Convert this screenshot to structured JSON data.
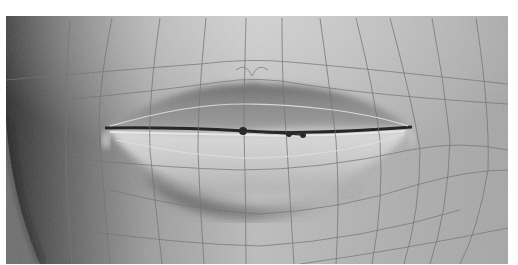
{
  "image": {
    "subject": "3D render of closed lips with wireframe mesh topology overlay",
    "palette": {
      "background_border": "#ffffff",
      "skin_light": "#cfcfcf",
      "skin_mid": "#a9a9a9",
      "skin_dark": "#3a3a3a",
      "mesh_line": "#6f6f6f",
      "lip_line_highlight": "#e2e2e2",
      "control_point": "#1e1e1e"
    },
    "control_points": [
      {
        "x": 243,
        "y": 131
      },
      {
        "x": 289,
        "y": 134
      },
      {
        "x": 303,
        "y": 135
      }
    ],
    "mouth_corners": {
      "left": {
        "x": 107,
        "y": 128
      },
      "right": {
        "x": 410,
        "y": 128
      }
    }
  }
}
